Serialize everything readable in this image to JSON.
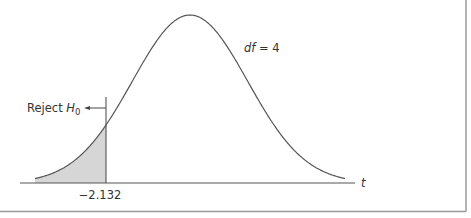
{
  "chart_data": {
    "type": "area",
    "title": "",
    "distribution": "t",
    "df": 4,
    "df_label": "df = 4",
    "df_label_parts": {
      "var": "df",
      "eq": " = ",
      "val": "4"
    },
    "xlabel": "t",
    "ylabel": "",
    "critical_value": -2.132,
    "critical_value_label": "−2.132",
    "rejection_region": {
      "side": "left",
      "from": "-inf",
      "to": -2.132,
      "shaded": true
    },
    "annotation": {
      "text": "Reject ",
      "subscript_var": "H",
      "subscript": "0",
      "arrow": "left"
    },
    "x_range": [
      -3.93,
      3.93
    ],
    "grid": false,
    "legend": null,
    "colors": {
      "curve": "#555555",
      "shade": "#d6d6d6",
      "axis": "#555555",
      "frame": "#9a9a9a",
      "text": "#333333"
    }
  },
  "layout": {
    "center_px": 190,
    "baseline_px": 183,
    "peak_px": 15,
    "sigma_px": 57.6,
    "left_px": 35,
    "right_px": 345,
    "axis_start_px": 20,
    "axis_end_px": 355,
    "crit_px": 106
  }
}
